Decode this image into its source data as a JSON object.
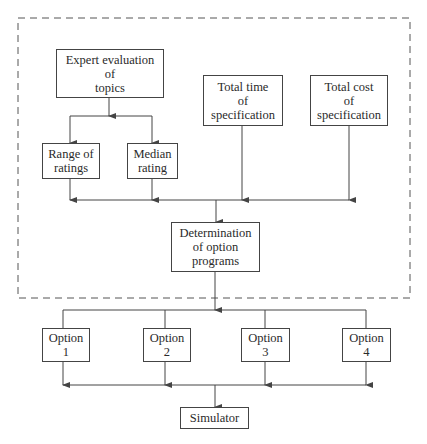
{
  "diagram": {
    "group_box": {
      "style": "dashed"
    },
    "nodes": {
      "expert": {
        "label": "Expert evaluation\nof\ntopics"
      },
      "total_time": {
        "label": "Total time\nof\nspecification"
      },
      "total_cost": {
        "label": "Total cost\nof\nspecification"
      },
      "range": {
        "label": "Range of\nratings"
      },
      "median": {
        "label": "Median\nrating"
      },
      "determination": {
        "label": "Determination\nof option\nprograms"
      },
      "option1": {
        "label": "Option\n1"
      },
      "option2": {
        "label": "Option\n2"
      },
      "option3": {
        "label": "Option\n3"
      },
      "option4": {
        "label": "Option\n4"
      },
      "simulator": {
        "label": "Simulator"
      }
    },
    "edges": [
      [
        "expert",
        "range"
      ],
      [
        "expert",
        "median"
      ],
      [
        "range",
        "determination"
      ],
      [
        "median",
        "determination"
      ],
      [
        "total_time",
        "determination"
      ],
      [
        "total_cost",
        "determination"
      ],
      [
        "determination",
        "option1"
      ],
      [
        "determination",
        "option2"
      ],
      [
        "determination",
        "option3"
      ],
      [
        "determination",
        "option4"
      ],
      [
        "option1",
        "simulator"
      ],
      [
        "option2",
        "simulator"
      ],
      [
        "option3",
        "simulator"
      ],
      [
        "option4",
        "simulator"
      ]
    ],
    "colors": {
      "line": "#444444",
      "text": "#2a2a2a",
      "background": "#ffffff"
    }
  }
}
